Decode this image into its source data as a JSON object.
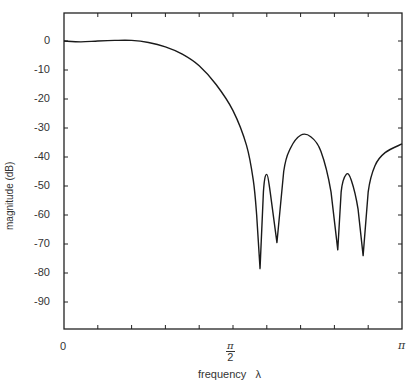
{
  "chart_data": {
    "type": "line",
    "title": "",
    "xlabel": "frequency λ",
    "ylabel": "magnitude (dB)",
    "xlim": [
      0,
      3.14159
    ],
    "ylim": [
      -100,
      10
    ],
    "grid": false,
    "legend": null,
    "x_tick_labels": [
      "0",
      "π/2",
      "π"
    ],
    "y_ticks": [
      0,
      -10,
      -20,
      -30,
      -40,
      -50,
      -60,
      -70,
      -80,
      -90
    ],
    "y_tick_labels": [
      "0",
      "-10",
      "-20",
      "-30",
      "-40",
      "-50",
      "-60",
      "-70",
      "-80",
      "-90"
    ],
    "series": [
      {
        "name": "magnitude",
        "x_over_pi": [
          0.0,
          0.05,
          0.1,
          0.15,
          0.2,
          0.25,
          0.3,
          0.35,
          0.4,
          0.45,
          0.5,
          0.54,
          0.56,
          0.57,
          0.58,
          0.59,
          0.6,
          0.61,
          0.63,
          0.65,
          0.67,
          0.7,
          0.73,
          0.76,
          0.79,
          0.81,
          0.82,
          0.835,
          0.85,
          0.87,
          0.885,
          0.9,
          0.92,
          0.95,
          1.0
        ],
        "y_db": [
          0.0,
          -0.3,
          0.0,
          0.2,
          0.2,
          -0.5,
          -2.0,
          -4.5,
          -8.5,
          -15.0,
          -24.0,
          -36.0,
          -48.0,
          -60.0,
          -78.5,
          -52.0,
          -46.0,
          -52.0,
          -69.5,
          -45.0,
          -37.0,
          -32.5,
          -33.0,
          -38.0,
          -52.0,
          -72.0,
          -52.0,
          -46.0,
          -48.0,
          -58.0,
          -74.0,
          -52.0,
          -43.0,
          -38.5,
          -35.5
        ]
      }
    ],
    "annotations": []
  },
  "labels": {
    "x_zero": "0",
    "x_half_num": "π",
    "x_half_den": "2",
    "x_pi": "π",
    "xlabel": "frequency   λ",
    "ylabel": "magnitude   (dB)"
  }
}
